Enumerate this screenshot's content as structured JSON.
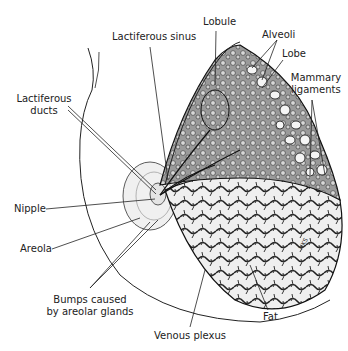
{
  "diagram": {
    "signature": "NKS",
    "labels": {
      "lobule": "Lobule",
      "lactiferous_sinus": "Lactiferous sinus",
      "alveoli": "Alveoli",
      "lobe": "Lobe",
      "mammary_ligaments_1": "Mammary",
      "mammary_ligaments_2": "ligaments",
      "lactiferous_ducts_1": "Lactiferous",
      "lactiferous_ducts_2": "ducts",
      "nipple": "Nipple",
      "areola": "Areola",
      "bumps_1": "Bumps caused",
      "bumps_2": "by areolar glands",
      "venous_plexus": "Venous plexus",
      "fat": "Fat"
    }
  }
}
